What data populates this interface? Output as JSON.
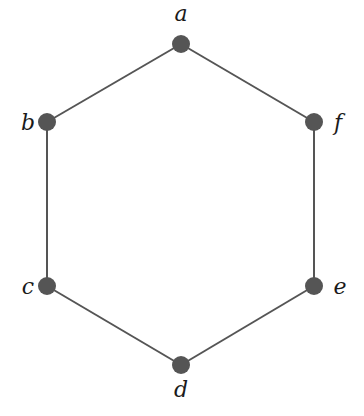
{
  "diagram": {
    "type": "graph",
    "colors": {
      "edge": "#555555",
      "node": "#555555",
      "label": "#1a1a1a"
    },
    "nodes": [
      {
        "id": "a",
        "label": "a",
        "x": 181,
        "y": 44,
        "label_x": 181,
        "label_y": 21,
        "anchor": "middle"
      },
      {
        "id": "b",
        "label": "b",
        "x": 47,
        "y": 122,
        "label_x": 28,
        "label_y": 130,
        "anchor": "middle"
      },
      {
        "id": "c",
        "label": "c",
        "x": 47,
        "y": 286,
        "label_x": 28,
        "label_y": 294,
        "anchor": "middle"
      },
      {
        "id": "d",
        "label": "d",
        "x": 181,
        "y": 365,
        "label_x": 181,
        "label_y": 397,
        "anchor": "middle"
      },
      {
        "id": "e",
        "label": "e",
        "x": 314,
        "y": 286,
        "label_x": 340,
        "label_y": 294,
        "anchor": "middle"
      },
      {
        "id": "f",
        "label": "f",
        "x": 314,
        "y": 122,
        "label_x": 338,
        "label_y": 130,
        "anchor": "middle"
      }
    ],
    "edges": [
      {
        "from": "a",
        "to": "b"
      },
      {
        "from": "b",
        "to": "c"
      },
      {
        "from": "c",
        "to": "d"
      },
      {
        "from": "d",
        "to": "e"
      },
      {
        "from": "e",
        "to": "f"
      },
      {
        "from": "f",
        "to": "a"
      }
    ]
  }
}
